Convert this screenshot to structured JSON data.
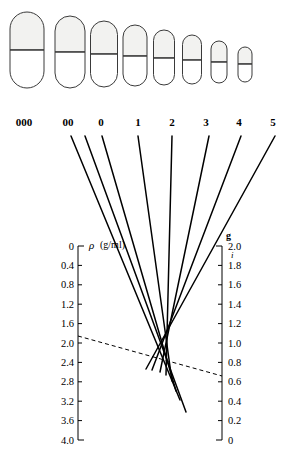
{
  "figure": {
    "background": "#ffffff",
    "line_color": "#000000",
    "capsule_cap_fill": "#f2f2f0",
    "capsule_body_fill": "#ffffff",
    "capsule_stroke": "#3a3a3a"
  },
  "capsules": {
    "caption": "Capsule shells drawn to relative scale, largest to smallest",
    "items": [
      {
        "size": "000",
        "cx": 27,
        "top": 12,
        "bottom": 88,
        "w": 34,
        "cap_split": 50
      },
      {
        "size": "00",
        "cx": 70,
        "top": 16,
        "bottom": 88,
        "w": 30,
        "cap_split": 52
      },
      {
        "size": "0",
        "cx": 104,
        "top": 21,
        "bottom": 87,
        "w": 27,
        "cap_split": 54
      },
      {
        "size": "1",
        "cx": 135,
        "top": 25,
        "bottom": 86,
        "w": 24,
        "cap_split": 56
      },
      {
        "size": "2",
        "cx": 164,
        "top": 30,
        "bottom": 85,
        "w": 21,
        "cap_split": 58
      },
      {
        "size": "3",
        "cx": 192,
        "top": 35,
        "bottom": 84,
        "w": 19,
        "cap_split": 60
      },
      {
        "size": "4",
        "cx": 219,
        "top": 41,
        "bottom": 83,
        "w": 16,
        "cap_split": 62
      },
      {
        "size": "5",
        "cx": 245,
        "top": 47,
        "bottom": 82,
        "w": 14,
        "cap_split": 64
      }
    ]
  },
  "size_labels": {
    "y": 126,
    "items": [
      {
        "text": "000",
        "x": 24
      },
      {
        "text": "00",
        "x": 68
      },
      {
        "text": "0",
        "x": 101
      },
      {
        "text": "1",
        "x": 138
      },
      {
        "text": "2",
        "x": 172
      },
      {
        "text": "3",
        "x": 206
      },
      {
        "text": "4",
        "x": 239
      },
      {
        "text": "5",
        "x": 273
      }
    ]
  },
  "chart_data": {
    "type": "line",
    "xlabel": "",
    "ylabel": "ρ (g/ml)",
    "grid": false,
    "legend": "none",
    "left_axis": {
      "name": "density-axis",
      "symbol": "ρ",
      "units": "(g/ml)",
      "x": 78,
      "y_top": 246,
      "y_bottom": 440,
      "range": [
        0,
        4.0
      ],
      "tick_step": 0.4,
      "ticks": [
        "0",
        "0.4",
        "0.8",
        "1.2",
        "1.6",
        "2.0",
        "2.4",
        "2.8",
        "3.2",
        "3.6",
        "4.0"
      ]
    },
    "right_axis": {
      "name": "fill-weight-axis",
      "symbol": "g",
      "units": "g",
      "x": 222,
      "y_top": 246,
      "y_bottom": 440,
      "range": [
        0,
        2.0
      ],
      "tick_step": 0.2,
      "ticks_top_to_bottom": [
        "2.0",
        "1.8",
        "1.6",
        "1.4",
        "1.2",
        "1.0",
        "0.8",
        "0.6",
        "0.4",
        "0.2",
        "0"
      ],
      "stray_mark": "i"
    },
    "series": [
      {
        "name": "000",
        "x1": 85,
        "y1": 136,
        "x2": 186,
        "y2": 412
      },
      {
        "name": "00",
        "x1": 71,
        "y1": 136,
        "x2": 180,
        "y2": 400
      },
      {
        "name": "0",
        "x1": 102,
        "y1": 136,
        "x2": 176,
        "y2": 391
      },
      {
        "name": "1",
        "x1": 138,
        "y1": 136,
        "x2": 172,
        "y2": 381
      },
      {
        "name": "2",
        "x1": 172,
        "y1": 136,
        "x2": 166,
        "y2": 375
      },
      {
        "name": "3",
        "x1": 209,
        "y1": 136,
        "x2": 160,
        "y2": 372
      },
      {
        "name": "4",
        "x1": 241,
        "y1": 136,
        "x2": 152,
        "y2": 370
      },
      {
        "name": "5",
        "x1": 275,
        "y1": 136,
        "x2": 146,
        "y2": 369
      }
    ],
    "reference_line": {
      "name": "isopleth",
      "style": "dashed",
      "left_value": 1.85,
      "right_value": 0.8,
      "x1": 78,
      "y1": 336,
      "x2": 222,
      "y2": 376
    },
    "annotations": [
      {
        "text": "ρ",
        "x": 89,
        "y": 249
      },
      {
        "text": "(g/ml)",
        "x": 100,
        "y": 248
      },
      {
        "text": "g",
        "x": 226,
        "y": 239
      },
      {
        "text": "i",
        "x": 231,
        "y": 258
      }
    ]
  }
}
